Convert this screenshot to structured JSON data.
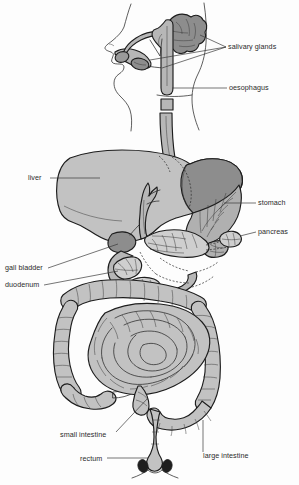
{
  "figure": {
    "background_color": "#fdfdfd",
    "line_color": "#1d1d1d",
    "text_color": "#2b2b2b",
    "width": 299,
    "height": 485
  },
  "palette": {
    "organ_light": "#c2c2c2",
    "organ_mid": "#b0b0b0",
    "organ_dark": "#8d8d8d",
    "organ_darkest": "#7a7a7a",
    "white": "#ffffff"
  },
  "labels": [
    {
      "id": "salivary-glands",
      "text": "salivary glands",
      "x": 228,
      "y": 49
    },
    {
      "id": "oesophagus",
      "text": "oesophagus",
      "x": 229,
      "y": 90
    },
    {
      "id": "liver",
      "text": "liver",
      "x": 28,
      "y": 180
    },
    {
      "id": "stomach",
      "text": "stomach",
      "x": 258,
      "y": 205
    },
    {
      "id": "pancreas",
      "text": "pancreas",
      "x": 258,
      "y": 234
    },
    {
      "id": "gall-bladder",
      "text": "gall bladder",
      "x": 5,
      "y": 270
    },
    {
      "id": "duodenum",
      "text": "duodenum",
      "x": 5,
      "y": 287
    },
    {
      "id": "small-intestine",
      "text": "small intestine",
      "x": 60,
      "y": 437
    },
    {
      "id": "rectum",
      "text": "rectum",
      "x": 80,
      "y": 461
    },
    {
      "id": "large-intestine",
      "text": "large intestine",
      "x": 203,
      "y": 458
    }
  ],
  "organs": [
    {
      "id": "head-profile",
      "name": "head profile"
    },
    {
      "id": "parotid-gland",
      "name": "parotid salivary gland"
    },
    {
      "id": "sublingual-gland",
      "name": "sublingual salivary gland"
    },
    {
      "id": "submandibular-gland",
      "name": "submandibular salivary gland"
    },
    {
      "id": "tongue",
      "name": "tongue"
    },
    {
      "id": "oesophagus-tube",
      "name": "oesophagus"
    },
    {
      "id": "liver-organ",
      "name": "liver"
    },
    {
      "id": "stomach-organ",
      "name": "stomach"
    },
    {
      "id": "gall-bladder-organ",
      "name": "gall bladder"
    },
    {
      "id": "pancreas-organ",
      "name": "pancreas"
    },
    {
      "id": "duodenum-organ",
      "name": "duodenum"
    },
    {
      "id": "small-intestine-organ",
      "name": "small intestine"
    },
    {
      "id": "large-intestine-organ",
      "name": "large intestine"
    },
    {
      "id": "rectum-organ",
      "name": "rectum"
    },
    {
      "id": "anus-organ",
      "name": "anus"
    }
  ]
}
